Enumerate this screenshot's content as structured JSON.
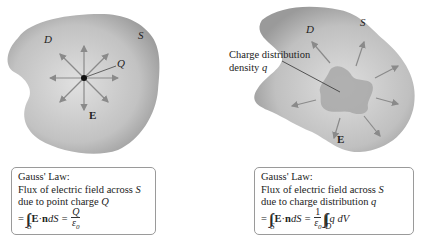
{
  "left_figure": {
    "region_label": "D",
    "surface_label": "S",
    "charge_label": "Q",
    "field_label": "E",
    "fill_color": "#b8b8b8",
    "arrow_color": "#8a8a8a",
    "caption": {
      "title": "Gauss' Law:",
      "line1_prefix": "Flux of electric field across ",
      "line1_var": "S",
      "line2_prefix": "due to point charge ",
      "line2_var": "Q",
      "eq_equals": "=",
      "eq_integral": "∫∫",
      "eq_integral_sub": "S",
      "eq_E": "E",
      "eq_dot": " · ",
      "eq_n": "n",
      "eq_dS": " dS = ",
      "eq_frac_num": "Q",
      "eq_frac_den": "ε",
      "eq_frac_den_sub": "0"
    }
  },
  "right_figure": {
    "region_label": "D",
    "surface_label": "S",
    "distribution_label_line1": "Charge distribution",
    "distribution_label_line2_prefix": "density ",
    "distribution_label_var": "q",
    "field_label": "E",
    "fill_color": "#b8b8b8",
    "inner_fill_color": "#a3a3a3",
    "caption": {
      "title": "Gauss' Law:",
      "line1_prefix": "Flux of electric field across ",
      "line1_var": "S",
      "line2_prefix": "due to charge distribution ",
      "line2_var": "q",
      "eq_equals": "=",
      "eq_integral": "∫∫",
      "eq_integral_sub": "S",
      "eq_E": "E",
      "eq_dot": " · ",
      "eq_n": "n",
      "eq_dS": " dS = ",
      "eq_frac_num": "1",
      "eq_frac_den": "ε",
      "eq_frac_den_sub": "0",
      "eq_triple": "∫∫∫",
      "eq_triple_sub": "D",
      "eq_tail": " q dV"
    }
  }
}
